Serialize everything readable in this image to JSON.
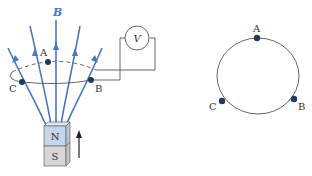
{
  "left_figure": {
    "field_label": "B",
    "meter_label": "V",
    "points": {
      "a": "A",
      "b": "B",
      "c": "C"
    },
    "magnet": {
      "north_label": "N",
      "south_label": "S",
      "north_color": "#c5d6ea",
      "south_color": "#d6d6d6",
      "motion_arrow": "up-arrow"
    },
    "field_color": "#4a78c0"
  },
  "right_figure": {
    "points": {
      "a": "A",
      "b": "B",
      "c": "C"
    }
  }
}
